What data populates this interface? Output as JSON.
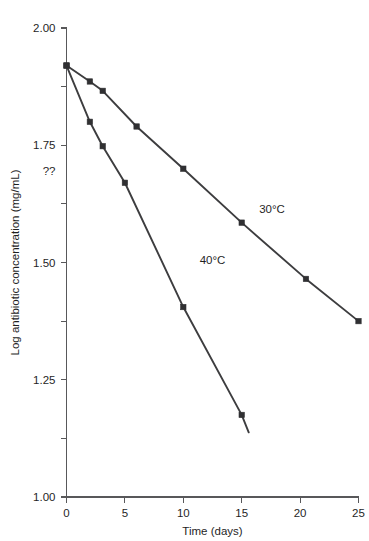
{
  "chart_data": {
    "type": "line",
    "title": "",
    "subtitle": "",
    "xlabel": "Time (days)",
    "ylabel": "Log antibiotic concentration (mg/mL)",
    "xlim": [
      0,
      25
    ],
    "ylim": [
      1.0,
      2.0
    ],
    "grid": false,
    "legend_position": "inline-annotations",
    "x_ticks": [
      0,
      5,
      10,
      15,
      20,
      25
    ],
    "x_tick_labels": [
      "0",
      "5",
      "10",
      "15",
      "20",
      "25"
    ],
    "x_minor_ticks": [],
    "y_ticks": [
      1.0,
      1.25,
      1.5,
      1.75,
      2.0
    ],
    "y_tick_labels": [
      "1.00",
      "1.25",
      "1.50",
      "1.75",
      "2.00"
    ],
    "y_minor_ticks": [
      1.125,
      1.375,
      1.625,
      1.875
    ],
    "y_unknown_tick": {
      "value": 1.695,
      "label": "??"
    },
    "series": [
      {
        "name": "30°C",
        "label": "30°C",
        "color": "#3d3d3f",
        "marker": "square",
        "annotation": {
          "text": "30°C",
          "x": 16.5,
          "y": 1.605
        },
        "points": [
          {
            "x": 0.0,
            "y": 1.92
          },
          {
            "x": 2.0,
            "y": 1.886
          },
          {
            "x": 3.1,
            "y": 1.866
          },
          {
            "x": 6.0,
            "y": 1.79
          },
          {
            "x": 10.0,
            "y": 1.7
          },
          {
            "x": 15.0,
            "y": 1.585
          },
          {
            "x": 20.5,
            "y": 1.465
          },
          {
            "x": 25.0,
            "y": 1.375
          }
        ]
      },
      {
        "name": "40°C",
        "label": "40°C",
        "color": "#3d3d3f",
        "marker": "square",
        "annotation": {
          "text": "40°C",
          "x": 11.4,
          "y": 1.497
        },
        "points": [
          {
            "x": 0.0,
            "y": 1.92
          },
          {
            "x": 2.0,
            "y": 1.8
          },
          {
            "x": 3.1,
            "y": 1.748
          },
          {
            "x": 5.0,
            "y": 1.67
          },
          {
            "x": 10.0,
            "y": 1.405
          },
          {
            "x": 15.0,
            "y": 1.175
          }
        ],
        "line_extends_to": {
          "x": 15.6,
          "y": 1.138
        }
      }
    ]
  }
}
